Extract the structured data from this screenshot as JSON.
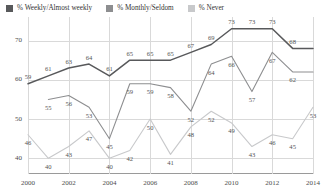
{
  "legend": {
    "items": [
      {
        "label": "% Weekly/Almost weekly",
        "color": "#58595b",
        "swatch_name": "legend-swatch-weekly"
      },
      {
        "label": "% Monthly/Seldom",
        "color": "#8d8e90",
        "swatch_name": "legend-swatch-monthly"
      },
      {
        "label": "% Never",
        "color": "#c8c9cb",
        "swatch_name": "legend-swatch-never"
      }
    ]
  },
  "axes": {
    "y_ticks": [
      "40",
      "50",
      "60",
      "70"
    ],
    "x_ticks": [
      "2000",
      "2002",
      "2004",
      "2006",
      "2008",
      "2010",
      "2012",
      "2014"
    ]
  },
  "chart_data": {
    "type": "line",
    "title": "",
    "xlabel": "",
    "ylabel": "",
    "ylim": [
      36,
      76
    ],
    "xlim": [
      2000,
      2014
    ],
    "grid": true,
    "legend_position": "top-left",
    "x": [
      2000,
      2001,
      2002,
      2003,
      2004,
      2005,
      2006,
      2007,
      2008,
      2009,
      2010,
      2011,
      2012,
      2013,
      2014
    ],
    "categories": [
      "2000",
      "2001",
      "2002",
      "2003",
      "2004",
      "2005",
      "2006",
      "2007",
      "2008",
      "2009",
      "2010",
      "2011",
      "2012",
      "2013",
      "2014"
    ],
    "series": [
      {
        "name": "% Weekly/Almost weekly",
        "color": "#58595b",
        "values": [
          59,
          61,
          63,
          64,
          61,
          65,
          65,
          65,
          67,
          69,
          73,
          73,
          73,
          68,
          68
        ]
      },
      {
        "name": "% Monthly/Seldom",
        "color": "#8d8e90",
        "values": [
          null,
          55,
          56,
          53,
          45,
          59,
          59,
          58,
          52,
          64,
          66,
          57,
          67,
          62,
          62
        ]
      },
      {
        "name": "% Never",
        "color": "#c8c9cb",
        "values": [
          46,
          40,
          43,
          47,
          40,
          42,
          50,
          41,
          48,
          52,
          49,
          43,
          46,
          45,
          53
        ]
      }
    ],
    "point_labels": [
      {
        "series": 0,
        "index": 0,
        "text": "59"
      },
      {
        "series": 0,
        "index": 1,
        "text": "61"
      },
      {
        "series": 0,
        "index": 2,
        "text": "63"
      },
      {
        "series": 0,
        "index": 3,
        "text": "64"
      },
      {
        "series": 0,
        "index": 4,
        "text": "61"
      },
      {
        "series": 0,
        "index": 5,
        "text": "65"
      },
      {
        "series": 0,
        "index": 6,
        "text": "65"
      },
      {
        "series": 0,
        "index": 7,
        "text": "65"
      },
      {
        "series": 0,
        "index": 8,
        "text": "67"
      },
      {
        "series": 0,
        "index": 9,
        "text": "69"
      },
      {
        "series": 0,
        "index": 10,
        "text": "73"
      },
      {
        "series": 0,
        "index": 11,
        "text": "73"
      },
      {
        "series": 0,
        "index": 12,
        "text": "73"
      },
      {
        "series": 0,
        "index": 13,
        "text": "68"
      },
      {
        "series": 1,
        "index": 1,
        "text": "55"
      },
      {
        "series": 1,
        "index": 2,
        "text": "56"
      },
      {
        "series": 1,
        "index": 3,
        "text": "53"
      },
      {
        "series": 1,
        "index": 4,
        "text": "45"
      },
      {
        "series": 1,
        "index": 5,
        "text": "59"
      },
      {
        "series": 1,
        "index": 6,
        "text": "59"
      },
      {
        "series": 1,
        "index": 7,
        "text": "58"
      },
      {
        "series": 1,
        "index": 8,
        "text": "52"
      },
      {
        "series": 1,
        "index": 9,
        "text": "64"
      },
      {
        "series": 1,
        "index": 10,
        "text": "66"
      },
      {
        "series": 1,
        "index": 11,
        "text": "57"
      },
      {
        "series": 1,
        "index": 12,
        "text": "67"
      },
      {
        "series": 1,
        "index": 13,
        "text": "62"
      },
      {
        "series": 2,
        "index": 0,
        "text": "46"
      },
      {
        "series": 2,
        "index": 1,
        "text": "40"
      },
      {
        "series": 2,
        "index": 2,
        "text": "43"
      },
      {
        "series": 2,
        "index": 3,
        "text": "47"
      },
      {
        "series": 2,
        "index": 4,
        "text": "40"
      },
      {
        "series": 2,
        "index": 5,
        "text": "42"
      },
      {
        "series": 2,
        "index": 6,
        "text": "50"
      },
      {
        "series": 2,
        "index": 7,
        "text": "41"
      },
      {
        "series": 2,
        "index": 8,
        "text": "48"
      },
      {
        "series": 2,
        "index": 9,
        "text": "52"
      },
      {
        "series": 2,
        "index": 10,
        "text": "49"
      },
      {
        "series": 2,
        "index": 11,
        "text": "43"
      },
      {
        "series": 2,
        "index": 12,
        "text": "46"
      },
      {
        "series": 2,
        "index": 13,
        "text": "45"
      },
      {
        "series": 2,
        "index": 14,
        "text": "53"
      }
    ]
  }
}
